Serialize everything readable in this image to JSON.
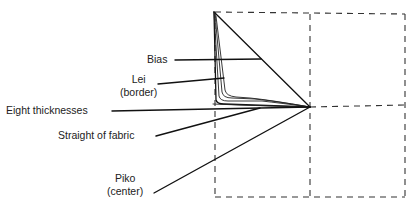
{
  "figure": {
    "ink_color": "#111111",
    "background": "#ffffff"
  },
  "labels": {
    "bias": "Bias",
    "lei_line1": "Lei",
    "lei_line2": "(border)",
    "eight_thicknesses": "Eight thicknesses",
    "straight_of_fabric": "Straight of fabric",
    "piko_line1": "Piko",
    "piko_line2": "(center)"
  }
}
